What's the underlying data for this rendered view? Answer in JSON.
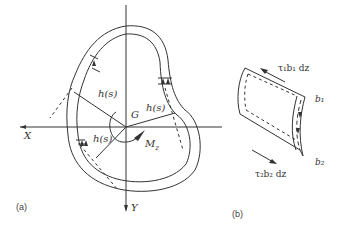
{
  "figure": {
    "panel_a": {
      "caption": "(a)",
      "axis_x_label": "X",
      "axis_y_label": "Y",
      "centroid_label": "G",
      "moment_label": "M",
      "moment_subscript": "z",
      "lever_arm_labels": [
        "h(s)",
        "h(s)",
        "h(s)"
      ]
    },
    "panel_b": {
      "caption": "(b)",
      "top_flow_label": "τ₁b₁ dz",
      "bottom_flow_label": "τ₂b₂ dz",
      "thickness_top": "b₁",
      "thickness_bottom": "b₂"
    },
    "colors": {
      "line": "#333333",
      "background": "#ffffff"
    }
  }
}
